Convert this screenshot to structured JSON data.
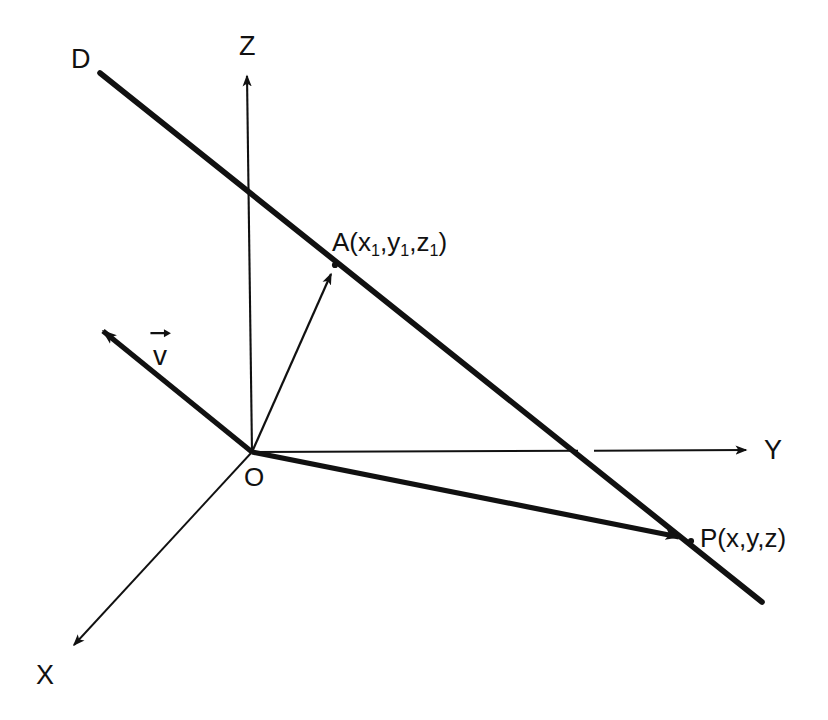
{
  "figure": {
    "type": "geometry-diagram",
    "background_color": "#ffffff",
    "stroke_color": "#111111"
  },
  "axes": [
    {
      "id": "z-axis",
      "label": "Z",
      "label_x": 239,
      "label_y": 33,
      "from": [
        252,
        452
      ],
      "to": [
        247,
        68
      ],
      "weight": "thin"
    },
    {
      "id": "y-axis",
      "label": "Y",
      "label_x": 764,
      "label_y": 437,
      "from": [
        252,
        452
      ],
      "to": [
        755,
        450
      ],
      "weight": "thin"
    },
    {
      "id": "x-axis",
      "label": "X",
      "label_x": 36,
      "label_y": 662,
      "from": [
        252,
        452
      ],
      "to": [
        65,
        655
      ],
      "weight": "thin"
    }
  ],
  "lines": [
    {
      "id": "line-d",
      "label": "D",
      "label_x": 71,
      "label_y": 46,
      "from": [
        100,
        73
      ],
      "to": [
        762,
        602
      ],
      "weight": "thick"
    }
  ],
  "vectors": [
    {
      "id": "vector-v",
      "label": "v",
      "label_x": 153,
      "label_y": 340,
      "from": [
        252,
        452
      ],
      "to": [
        92,
        322
      ],
      "weight": "thick",
      "has_arrow_accent": true
    },
    {
      "id": "vector-oa",
      "label": "",
      "from": [
        252,
        452
      ],
      "to": [
        335,
        265
      ],
      "weight": "thin"
    },
    {
      "id": "vector-op",
      "label": "",
      "from": [
        252,
        452
      ],
      "to": [
        690,
        540
      ],
      "weight": "thick"
    }
  ],
  "points": [
    {
      "id": "point-origin",
      "label": "O",
      "label_x": 244,
      "label_y": 464,
      "x": 252,
      "y": 452
    },
    {
      "id": "point-a",
      "label_prefix": "A(x",
      "label_sub1": "1",
      "label_mid1": ",y",
      "label_sub2": "1",
      "label_mid2": ",z",
      "label_sub3": "1",
      "label_suffix": ")",
      "label_x": 332,
      "label_y": 229,
      "x": 335,
      "y": 265
    },
    {
      "id": "point-p",
      "label": "P(x,y,z)",
      "label_x": 700,
      "label_y": 525,
      "x": 690,
      "y": 540
    }
  ]
}
